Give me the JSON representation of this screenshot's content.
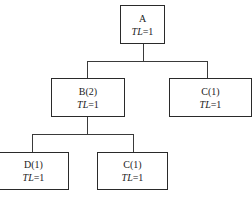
{
  "diagram": {
    "type": "tree",
    "nodes": [
      {
        "id": "A",
        "label": "A",
        "tl_var": "TL",
        "tl_value": "=1"
      },
      {
        "id": "B",
        "label": "B(2)",
        "tl_var": "TL",
        "tl_value": "=1"
      },
      {
        "id": "C_top",
        "label": "C(1)",
        "tl_var": "TL",
        "tl_value": "=1"
      },
      {
        "id": "D",
        "label": "D(1)",
        "tl_var": "TL",
        "tl_value": "=1"
      },
      {
        "id": "C_bottom",
        "label": "C(1)",
        "tl_var": "TL",
        "tl_value": "=1"
      }
    ],
    "edges": [
      {
        "from": "A",
        "to": "B"
      },
      {
        "from": "A",
        "to": "C_top"
      },
      {
        "from": "B",
        "to": "D"
      },
      {
        "from": "B",
        "to": "C_bottom"
      }
    ]
  }
}
